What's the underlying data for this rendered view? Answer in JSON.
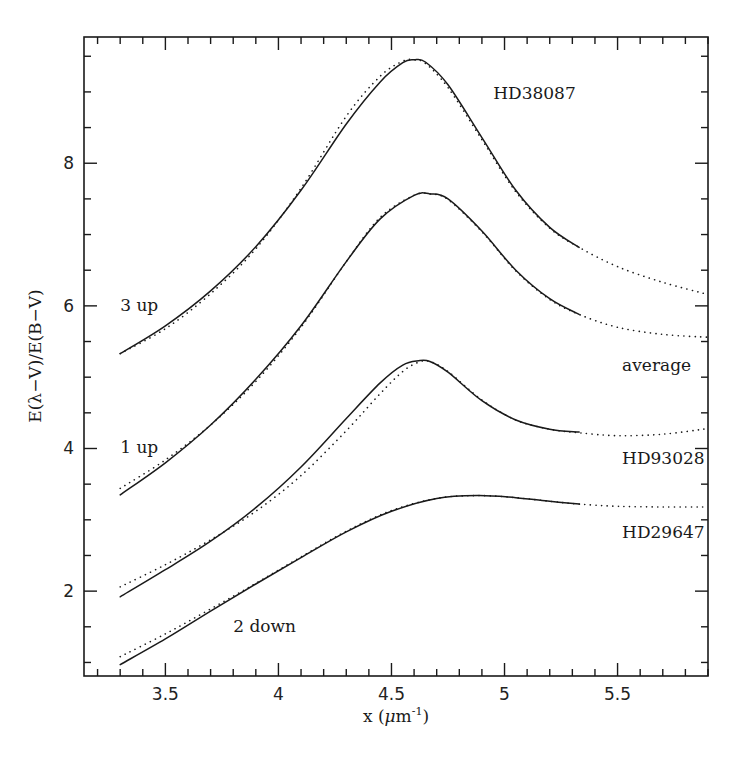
{
  "chart_data": {
    "type": "line",
    "title": "",
    "xlabel": "x (μm⁻¹)",
    "xlabel_parts": {
      "main": "x (",
      "mu": "μ",
      "m": "m",
      "sup": "-1",
      "close": ")"
    },
    "ylabel": "E(λ−V)/E(B−V)",
    "xlim": [
      3.14,
      5.9
    ],
    "ylim": [
      0.81,
      9.77
    ],
    "x_ticks": [
      3.5,
      4,
      4.5,
      5,
      5.5
    ],
    "x_tick_labels": [
      "3.5",
      "4",
      "4.5",
      "5",
      "5.5"
    ],
    "x_minor_step": 0.1,
    "y_ticks": [
      2,
      4,
      6,
      8
    ],
    "y_tick_labels": [
      "2",
      "4",
      "6",
      "8"
    ],
    "y_minor_step": 0.5,
    "grid": false,
    "legend": null,
    "annotations": [
      {
        "text": "HD38087",
        "x": 4.95,
        "y": 8.9
      },
      {
        "text": "3 up",
        "x": 3.3,
        "y": 5.93
      },
      {
        "text": "average",
        "x": 5.52,
        "y": 5.08
      },
      {
        "text": "1 up",
        "x": 3.3,
        "y": 3.94
      },
      {
        "text": "HD93028",
        "x": 5.52,
        "y": 3.78
      },
      {
        "text": "HD29647",
        "x": 5.52,
        "y": 2.74
      },
      {
        "text": "2 down",
        "x": 3.8,
        "y": 1.43
      }
    ],
    "series": [
      {
        "name": "HD38087 (observed, 3 up)",
        "style": "solid",
        "x": [
          3.3,
          3.5,
          3.7,
          3.9,
          4.1,
          4.3,
          4.45,
          4.55,
          4.6,
          4.65,
          4.75,
          4.9,
          5.05,
          5.2,
          5.33
        ],
        "y": [
          5.33,
          5.72,
          6.21,
          6.83,
          7.62,
          8.55,
          9.14,
          9.41,
          9.45,
          9.42,
          9.1,
          8.36,
          7.62,
          7.1,
          6.82
        ]
      },
      {
        "name": "HD38087 (fit, 3 up)",
        "style": "dotted",
        "x": [
          3.3,
          3.5,
          3.7,
          3.9,
          4.1,
          4.3,
          4.45,
          4.55,
          4.6,
          4.65,
          4.75,
          4.9,
          5.05,
          5.2,
          5.33,
          5.5,
          5.7,
          5.9
        ],
        "y": [
          5.33,
          5.68,
          6.17,
          6.8,
          7.65,
          8.66,
          9.22,
          9.43,
          9.45,
          9.4,
          9.06,
          8.33,
          7.6,
          7.09,
          6.82,
          6.55,
          6.33,
          6.16
        ]
      },
      {
        "name": "Average (observed, 1 up)",
        "style": "solid",
        "x": [
          3.3,
          3.5,
          3.7,
          3.9,
          4.1,
          4.3,
          4.45,
          4.6,
          4.67,
          4.75,
          4.9,
          5.05,
          5.2,
          5.33
        ],
        "y": [
          3.35,
          3.8,
          4.33,
          4.97,
          5.72,
          6.62,
          7.22,
          7.55,
          7.57,
          7.5,
          7.05,
          6.5,
          6.1,
          5.88
        ]
      },
      {
        "name": "Average (fit, 1 up)",
        "style": "dotted",
        "x": [
          3.3,
          3.5,
          3.7,
          3.9,
          4.1,
          4.3,
          4.45,
          4.6,
          4.67,
          4.75,
          4.9,
          5.05,
          5.2,
          5.33,
          5.5,
          5.7,
          5.9
        ],
        "y": [
          3.44,
          3.84,
          4.33,
          4.94,
          5.7,
          6.62,
          7.24,
          7.55,
          7.57,
          7.49,
          7.04,
          6.49,
          6.09,
          5.88,
          5.7,
          5.6,
          5.56
        ]
      },
      {
        "name": "HD93028 (observed)",
        "style": "solid",
        "x": [
          3.3,
          3.5,
          3.7,
          3.9,
          4.1,
          4.3,
          4.45,
          4.55,
          4.62,
          4.67,
          4.75,
          4.9,
          5.05,
          5.2,
          5.33
        ],
        "y": [
          1.92,
          2.3,
          2.7,
          3.17,
          3.74,
          4.42,
          4.92,
          5.17,
          5.23,
          5.22,
          5.07,
          4.67,
          4.4,
          4.27,
          4.23
        ]
      },
      {
        "name": "HD93028 (fit)",
        "style": "dotted",
        "x": [
          3.3,
          3.5,
          3.7,
          3.9,
          4.1,
          4.3,
          4.45,
          4.55,
          4.62,
          4.67,
          4.75,
          4.9,
          5.05,
          5.2,
          5.33,
          5.5,
          5.7,
          5.9
        ],
        "y": [
          2.06,
          2.37,
          2.72,
          3.12,
          3.62,
          4.25,
          4.77,
          5.08,
          5.21,
          5.22,
          5.08,
          4.68,
          4.4,
          4.27,
          4.22,
          4.18,
          4.2,
          4.28
        ]
      },
      {
        "name": "HD29647 (observed, 2 down)",
        "style": "solid",
        "x": [
          3.3,
          3.5,
          3.7,
          3.9,
          4.1,
          4.3,
          4.5,
          4.7,
          4.88,
          5.05,
          5.2,
          5.33
        ],
        "y": [
          0.97,
          1.33,
          1.72,
          2.1,
          2.47,
          2.83,
          3.12,
          3.3,
          3.34,
          3.31,
          3.26,
          3.22
        ]
      },
      {
        "name": "HD29647 (fit, 2 down)",
        "style": "dotted",
        "x": [
          3.3,
          3.5,
          3.7,
          3.9,
          4.1,
          4.3,
          4.5,
          4.7,
          4.88,
          5.05,
          5.2,
          5.33,
          5.5,
          5.7,
          5.9
        ],
        "y": [
          1.08,
          1.4,
          1.75,
          2.11,
          2.48,
          2.84,
          3.13,
          3.3,
          3.34,
          3.31,
          3.26,
          3.22,
          3.19,
          3.18,
          3.18
        ]
      }
    ]
  }
}
